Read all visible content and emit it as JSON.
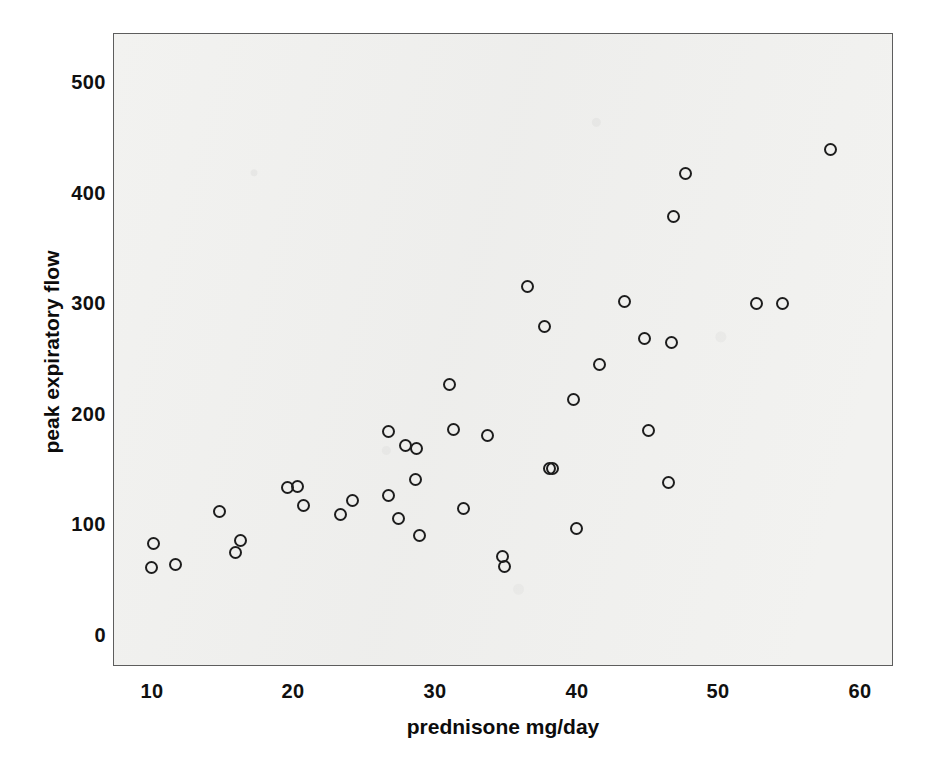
{
  "chart_data": {
    "type": "scatter",
    "title": "",
    "xlabel": "prednisone mg/day",
    "ylabel": "peak expiratory flow",
    "xlim": [
      6.5,
      62.5
    ],
    "ylim": [
      -25,
      545
    ],
    "xticks": [
      10,
      20,
      30,
      40,
      50,
      60
    ],
    "xtick_labels": [
      "10",
      "20",
      "30",
      "40",
      "50",
      "60"
    ],
    "yticks": [
      0,
      100,
      200,
      300,
      400,
      500
    ],
    "ytick_labels": [
      "0",
      "100",
      "200",
      "300",
      "400",
      "500"
    ],
    "grid": false,
    "legend": null,
    "marker": {
      "shape": "open-circle",
      "edge_color": "#1d1d1d",
      "fill_color": "none",
      "size_px": 13
    },
    "plot_background": "#f2f2f0",
    "frame_color": "#5d5d5d",
    "n_points": 41,
    "points": [
      {
        "x": 10.0,
        "y": 84
      },
      {
        "x": 9.9,
        "y": 62
      },
      {
        "x": 11.6,
        "y": 65
      },
      {
        "x": 14.7,
        "y": 113
      },
      {
        "x": 15.8,
        "y": 76
      },
      {
        "x": 16.2,
        "y": 86
      },
      {
        "x": 19.5,
        "y": 134
      },
      {
        "x": 20.2,
        "y": 135
      },
      {
        "x": 20.6,
        "y": 118
      },
      {
        "x": 23.2,
        "y": 110
      },
      {
        "x": 24.1,
        "y": 123
      },
      {
        "x": 26.6,
        "y": 185
      },
      {
        "x": 26.6,
        "y": 127
      },
      {
        "x": 27.3,
        "y": 106
      },
      {
        "x": 27.8,
        "y": 172
      },
      {
        "x": 28.6,
        "y": 170
      },
      {
        "x": 28.5,
        "y": 142
      },
      {
        "x": 28.8,
        "y": 91
      },
      {
        "x": 30.9,
        "y": 228
      },
      {
        "x": 31.2,
        "y": 187
      },
      {
        "x": 31.9,
        "y": 115
      },
      {
        "x": 33.6,
        "y": 181
      },
      {
        "x": 34.7,
        "y": 72
      },
      {
        "x": 34.8,
        "y": 63
      },
      {
        "x": 36.4,
        "y": 316
      },
      {
        "x": 37.6,
        "y": 280
      },
      {
        "x": 38.2,
        "y": 152
      },
      {
        "x": 39.7,
        "y": 214
      },
      {
        "x": 39.9,
        "y": 97
      },
      {
        "x": 41.5,
        "y": 246
      },
      {
        "x": 43.3,
        "y": 303
      },
      {
        "x": 44.7,
        "y": 269
      },
      {
        "x": 45.0,
        "y": 186
      },
      {
        "x": 46.6,
        "y": 266
      },
      {
        "x": 46.4,
        "y": 139
      },
      {
        "x": 46.7,
        "y": 380
      },
      {
        "x": 47.6,
        "y": 419
      },
      {
        "x": 52.6,
        "y": 301
      },
      {
        "x": 54.4,
        "y": 301
      },
      {
        "x": 57.8,
        "y": 440
      },
      {
        "x": 38.0,
        "y": 152
      }
    ]
  }
}
